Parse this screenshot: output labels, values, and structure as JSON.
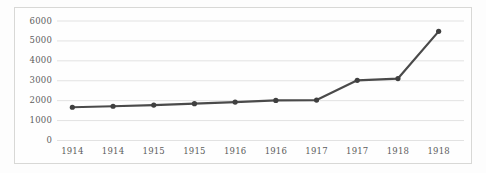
{
  "chart_data": {
    "type": "line",
    "title": "",
    "subtitle": "",
    "xlabel": "",
    "ylabel": "",
    "categories": [
      "1914",
      "1914",
      "1915",
      "1915",
      "1916",
      "1916",
      "1917",
      "1917",
      "1918",
      "1918"
    ],
    "values": [
      1670,
      1720,
      1780,
      1850,
      1930,
      2010,
      2030,
      3020,
      3110,
      5480
    ],
    "series": [
      {
        "name": "",
        "values": [
          1670,
          1720,
          1780,
          1850,
          1930,
          2010,
          2030,
          3020,
          3110,
          5480
        ]
      }
    ],
    "ylim": [
      0,
      6000
    ],
    "yticks": [
      0,
      1000,
      2000,
      3000,
      4000,
      5000,
      6000
    ],
    "ytick_labels": [
      "0",
      "1000",
      "2000",
      "3000",
      "4000",
      "5000",
      "6000"
    ],
    "xtick_labels": [
      "1914",
      "1914",
      "1915",
      "1915",
      "1916",
      "1916",
      "1917",
      "1917",
      "1918",
      "1918"
    ],
    "grid": "horizontal",
    "legend": "none",
    "marker": "circle",
    "line_color": "#4a4a4a",
    "marker_color": "#3f3f3f",
    "grid_color": "#e2e2e2",
    "border_color": "#d8d8d6",
    "tick_label_color": "#5d5d5d",
    "background_color": "#fefefe"
  }
}
